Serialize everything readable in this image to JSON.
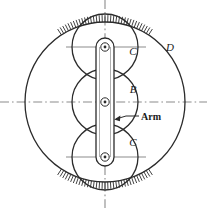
{
  "figure": {
    "background_color": "#ffffff",
    "line_color": "#2b2b2b",
    "centerline_color": "#8c8c8c",
    "label_color": "#1a1a1a"
  },
  "labels": {
    "gear_top": "C",
    "gear_middle": "B",
    "gear_bottom": "C",
    "ring_gear": "D",
    "arm": "Arm"
  },
  "geometry": {
    "ring_gear": {
      "cx": 105,
      "cy": 102,
      "r": 80
    },
    "gear_top": {
      "cx": 105,
      "cy": 47,
      "r": 33
    },
    "gear_middle": {
      "cx": 105,
      "cy": 102,
      "r": 33
    },
    "gear_bottom": {
      "cx": 105,
      "cy": 157,
      "r": 33
    },
    "arm": {
      "cx": 105,
      "y_top": 47,
      "y_bottom": 157,
      "half_width": 9
    },
    "pivot_outer_r": 4.2,
    "pivot_inner_r": 1.4
  },
  "label_positions": {
    "gear_top": {
      "x": 133,
      "y": 55
    },
    "ring_gear": {
      "x": 170,
      "y": 51
    },
    "gear_middle": {
      "x": 133,
      "y": 93
    },
    "gear_bottom": {
      "x": 133,
      "y": 146
    },
    "arm": {
      "x": 141,
      "y": 122
    }
  },
  "hatching": {
    "description": "short radial tick marks outside the ring gear arc",
    "tick_length": 7,
    "top_arc_start_deg": -123,
    "top_arc_end_deg": -57,
    "bottom_arc_start_deg": 57,
    "bottom_arc_end_deg": 123,
    "tick_count_per_arc": 34
  },
  "centerlines": {
    "vertical": {
      "x": 105,
      "y1": 0,
      "y2": 208
    },
    "horizontal_main": {
      "y": 102,
      "x1": 0,
      "x2": 207
    },
    "horizontal_top_gear": {
      "y": 47,
      "x1": 66,
      "x2": 146
    },
    "horizontal_bottom_gear": {
      "y": 157,
      "x1": 66,
      "x2": 146
    },
    "dash_pattern": "9 3 1.6 3"
  },
  "arm_leader": {
    "tip_x": 115,
    "tip_y": 119,
    "elbow_x": 126,
    "elbow_y": 116,
    "end_x": 139,
    "end_y": 116
  }
}
